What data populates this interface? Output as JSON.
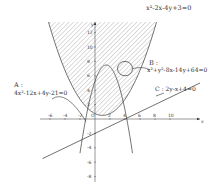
{
  "chart_data": {
    "type": "diagram",
    "title": "",
    "xlabel": "x",
    "ylabel": "y",
    "xlim": [
      -7,
      11
    ],
    "ylim": [
      -8.5,
      13.5
    ],
    "x_ticks": [
      "-6",
      "-4",
      "-2",
      "0",
      "2",
      "4",
      "6",
      "8",
      "10"
    ],
    "y_ticks": [
      "-8",
      "-6",
      "-4",
      "-2",
      "2",
      "4",
      "6",
      "8",
      "10",
      "12"
    ],
    "curves": [
      {
        "id": "P",
        "equation": "x²-2x-4y+3=0",
        "kind": "parabola",
        "vertex": [
          1,
          0.5
        ],
        "opens": "up",
        "region": "hatched inside"
      },
      {
        "id": "A",
        "equation": "4x²-12x+4y-21=0",
        "kind": "parabola",
        "vertex": [
          1.5,
          7.5
        ],
        "opens": "down"
      },
      {
        "id": "B",
        "equation": "x²+y²-8x-14y+64=0",
        "kind": "circle",
        "center": [
          4,
          7
        ],
        "radius": 1
      },
      {
        "id": "C",
        "equation": "2y-x+4=0",
        "kind": "line",
        "slope": 0.5,
        "intercept": -2
      }
    ]
  },
  "labels": {
    "parabola_eq": "x²-2x-4y+3=0",
    "a_name": "A :",
    "a_eq": "4x²-12x+4y-21=0",
    "b_name": "B :",
    "b_eq": "x²+y²-8x-14y+64=0",
    "c_eq": "C : 2y-x+4=0",
    "x_axis": "x",
    "y_axis": "y",
    "origin": "O"
  },
  "axis": {
    "x_ticks": [
      {
        "v": -6,
        "t": "-6"
      },
      {
        "v": -4,
        "t": "-4"
      },
      {
        "v": -2,
        "t": "-2"
      },
      {
        "v": 2,
        "t": "2"
      },
      {
        "v": 4,
        "t": "4"
      },
      {
        "v": 6,
        "t": "6"
      },
      {
        "v": 8,
        "t": "8"
      },
      {
        "v": 10,
        "t": "10"
      }
    ],
    "y_ticks": [
      {
        "v": -8,
        "t": "-8"
      },
      {
        "v": -6,
        "t": "-6"
      },
      {
        "v": -4,
        "t": "-4"
      },
      {
        "v": -2,
        "t": "-2"
      },
      {
        "v": 2,
        "t": "2"
      },
      {
        "v": 4,
        "t": "4"
      },
      {
        "v": 6,
        "t": "6"
      },
      {
        "v": 8,
        "t": "8"
      },
      {
        "v": 10,
        "t": "10"
      },
      {
        "v": 12,
        "t": "12"
      }
    ]
  }
}
